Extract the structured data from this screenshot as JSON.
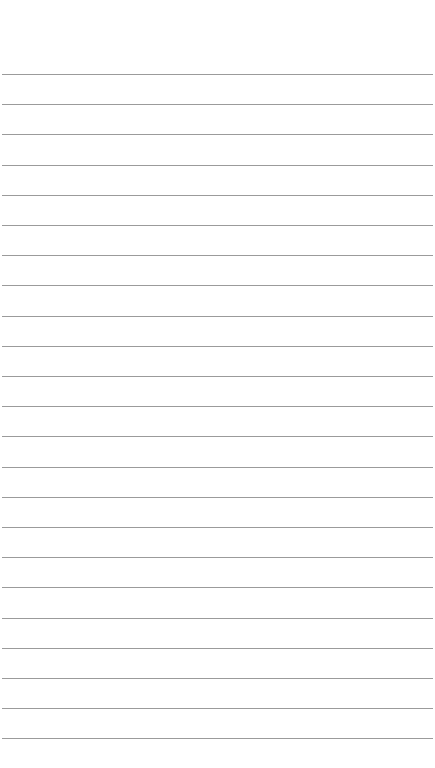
{
  "page": {
    "type": "lined-paper",
    "background_color": "#ffffff",
    "line_color": "#8a8a8a",
    "line_count": 23,
    "first_line_y": 74,
    "line_spacing": 30.2
  }
}
